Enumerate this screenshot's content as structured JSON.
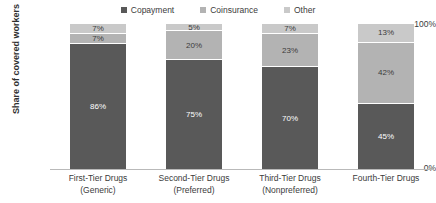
{
  "chart_data": {
    "type": "bar",
    "subtype": "stacked-100",
    "title": "",
    "xlabel": "",
    "ylabel": "Share of covered workers",
    "ylim": [
      0,
      100
    ],
    "ytick_labels": [
      "100%",
      "0%"
    ],
    "grid": false,
    "legend_position": "top-center",
    "categories": [
      "First-Tier Drugs (Generic)",
      "Second-Tier Drugs (Preferred)",
      "Third-Tier Drugs (Nonpreferred)",
      "Fourth-Tier Drugs"
    ],
    "category_lines": [
      [
        "First-Tier Drugs",
        "(Generic)"
      ],
      [
        "Second-Tier Drugs",
        "(Preferred)"
      ],
      [
        "Third-Tier Drugs",
        "(Nonpreferred)"
      ],
      [
        "Fourth-Tier Drugs",
        ""
      ]
    ],
    "series": [
      {
        "name": "Copayment",
        "color": "#595959",
        "values": [
          86,
          75,
          70,
          45
        ],
        "labels": [
          "86%",
          "75%",
          "70%",
          "45%"
        ]
      },
      {
        "name": "Coinsurance",
        "color": "#b3b3b3",
        "values": [
          7,
          20,
          23,
          42
        ],
        "labels": [
          "7%",
          "20%",
          "23%",
          "42%"
        ]
      },
      {
        "name": "Other",
        "color": "#c9c9c9",
        "values": [
          7,
          5,
          7,
          13
        ],
        "labels": [
          "7%",
          "5%",
          "7%",
          "13%"
        ]
      }
    ]
  },
  "legend": {
    "items": [
      {
        "label": "Copayment",
        "color": "#595959"
      },
      {
        "label": "Coinsurance",
        "color": "#b3b3b3"
      },
      {
        "label": "Other",
        "color": "#c9c9c9"
      }
    ]
  },
  "axis": {
    "y_title": "Share of covered workers",
    "y_top": "100%",
    "y_bottom": "0%"
  }
}
